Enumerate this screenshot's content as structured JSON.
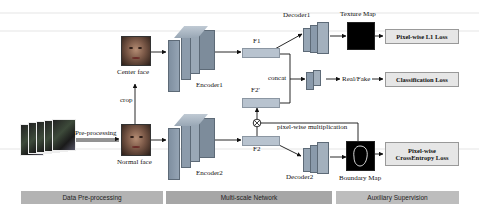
{
  "figure": {
    "type": "architecture-diagram",
    "inputs": {
      "pre_processing_label": "Pre-processing",
      "crop_label": "crop",
      "center_face_label": "Center face",
      "normal_face_label": "Normal face"
    },
    "encoders": [
      {
        "label": "Encoder1"
      },
      {
        "label": "Encoder2"
      }
    ],
    "features": {
      "f1": "F1",
      "f2": "F2",
      "f2_prime": "F2'",
      "concat_label": "concat",
      "multiplication_label": "pixel-wise multiplication",
      "multiply_symbol": "⊗"
    },
    "decoders": [
      {
        "label": "Decoder1"
      },
      {
        "label": "Decoder2"
      }
    ],
    "outputs": {
      "texture_map_label": "Texture Map",
      "boundary_map_label": "Boundary Map",
      "real_fake_label": "Real/Fake"
    },
    "losses": {
      "l1": "Pixel-wise L1 Loss",
      "classification": "Classification Loss",
      "cross_entropy_line1": "Pixel-wise",
      "cross_entropy_line2": "CrossEntropy Loss"
    },
    "stages": [
      {
        "label": "Data Pre-processing",
        "color": "#b3b3b3"
      },
      {
        "label": "Multi-scale Network",
        "color": "#a6a6a6"
      },
      {
        "label": "Auxiliary Supervision",
        "color": "#bdbdbd"
      }
    ],
    "colors": {
      "encoder_block": "#8a9aab",
      "feature_box": "#b8c3cf",
      "loss_box": "#e6e6e6",
      "map_bg": "#000000"
    }
  }
}
